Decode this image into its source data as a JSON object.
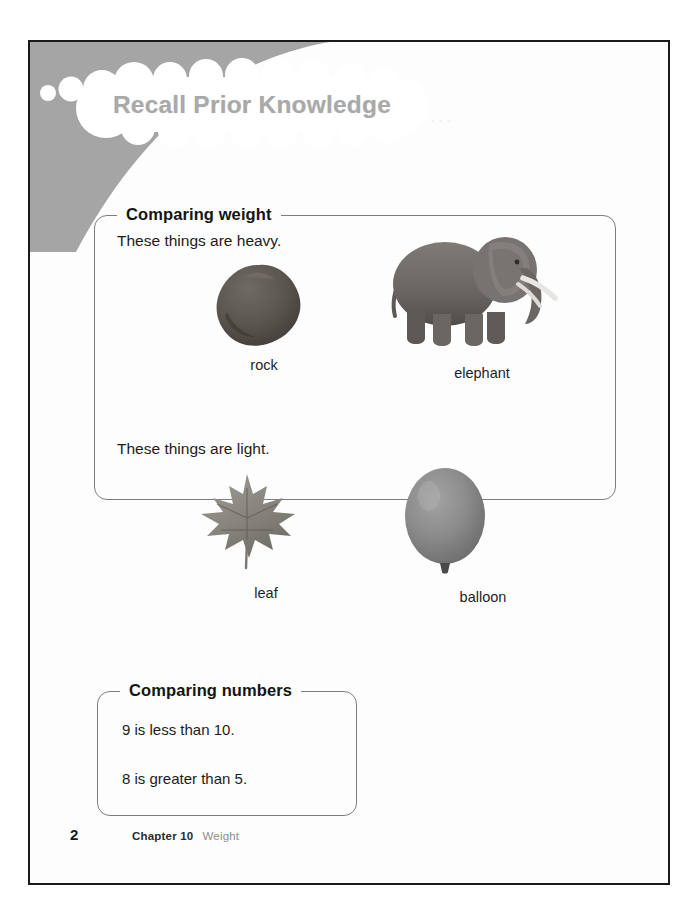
{
  "page": {
    "title": "Recall Prior Knowledge",
    "background_color": "#fdfdfd",
    "border_color": "#1a1a1a",
    "corner_wash_color": "#a5a5a5",
    "title_color": "#a9a9a9"
  },
  "sections": [
    {
      "id": "comparing-weight",
      "legend": "Comparing weight",
      "statements": [
        "These things are heavy.",
        "These things are light."
      ],
      "figures": [
        {
          "id": "rock",
          "caption": "rock",
          "icon": "rock-icon",
          "color": "#5c5650"
        },
        {
          "id": "elephant",
          "caption": "elephant",
          "icon": "elephant-icon",
          "color": "#6f6a66"
        },
        {
          "id": "leaf",
          "caption": "leaf",
          "icon": "leaf-icon",
          "color": "#8a8681"
        },
        {
          "id": "balloon",
          "caption": "balloon",
          "icon": "balloon-icon",
          "color": "#8b8b8b"
        }
      ]
    },
    {
      "id": "comparing-numbers",
      "legend": "Comparing numbers",
      "lines": [
        "9 is less than 10.",
        "8 is greater than 5."
      ]
    }
  ],
  "footer": {
    "page_number": "2",
    "chapter": "Chapter 10",
    "topic": "Weight"
  }
}
